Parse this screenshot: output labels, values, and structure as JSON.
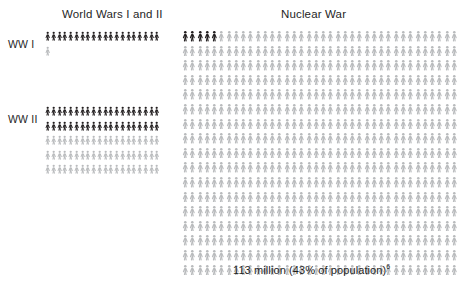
{
  "panels": {
    "wars": {
      "title": "World Wars I and II",
      "rows": [
        {
          "label": "WW I",
          "dark_count": 20,
          "light_count": 1,
          "per_row": 20,
          "total_rows": 2
        },
        {
          "label": "WW II",
          "dark_count": 40,
          "light_count": 60,
          "per_row": 20,
          "total_rows": 5
        }
      ]
    },
    "nuclear": {
      "title": "Nuclear War",
      "caption_value": "113 million (43% of population)",
      "caption_footnote": "6",
      "dark_count": 5,
      "light_count": 641,
      "per_row": 38,
      "total_rows": 17
    }
  },
  "colors": {
    "figure_dark": "#231f20",
    "figure_light": "#b9bbbd",
    "text": "#1f1f1f",
    "background": "#ffffff"
  },
  "chart_data": {
    "type": "pictogram",
    "unit_description": "each figure represents an equal number of casualties",
    "groups": [
      {
        "panel": "World Wars I and II",
        "name": "WW I",
        "highlighted_units": 20,
        "remaining_units": 1,
        "total_units": 21
      },
      {
        "panel": "World Wars I and II",
        "name": "WW II",
        "highlighted_units": 40,
        "remaining_units": 60,
        "total_units": 100
      },
      {
        "panel": "Nuclear War",
        "name": "Nuclear War",
        "highlighted_units": 5,
        "remaining_units": 641,
        "total_units": 646,
        "label": "113 million (43% of population)",
        "footnote": "6"
      }
    ],
    "legend": [],
    "xlabel": "",
    "ylabel": ""
  }
}
